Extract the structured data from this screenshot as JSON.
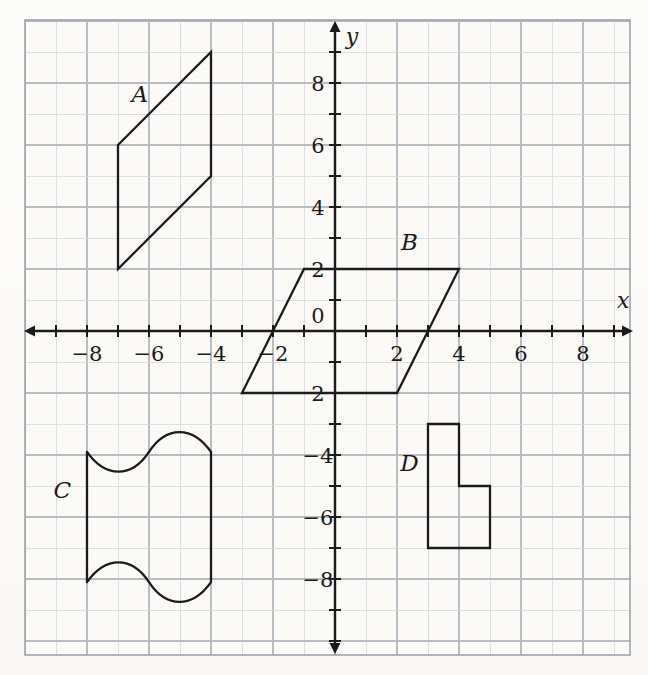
{
  "figure": {
    "kind": "coordinate-plane-with-figures",
    "background_color": "#fbfaf7",
    "grid_color": "#b9bcc2",
    "grid_minor_color": "#d6d8dc",
    "axis_color": "#1b1b1b",
    "shape_stroke_color": "#1b1b1b",
    "frame": {
      "x_min_px": 25,
      "y_min_px": 20,
      "x_max_px": 630,
      "y_max_px": 655
    },
    "origin_px": {
      "x": 335,
      "y": 331
    },
    "unit_px": 31,
    "x_range": [
      -9.9,
      9.5
    ],
    "y_range": [
      -10.4,
      9.9
    ]
  },
  "axes": {
    "x_axis_label": "x",
    "y_axis_label": "y",
    "origin_label": "0",
    "x_tick_labels": [
      {
        "value": -8,
        "text": "−8"
      },
      {
        "value": -6,
        "text": "−6"
      },
      {
        "value": -4,
        "text": "−4"
      },
      {
        "value": -2,
        "text": "−2"
      },
      {
        "value": 2,
        "text": "2"
      },
      {
        "value": 4,
        "text": "4"
      },
      {
        "value": 6,
        "text": "6"
      },
      {
        "value": 8,
        "text": "8"
      }
    ],
    "y_tick_labels": [
      {
        "value": 8,
        "text": "8"
      },
      {
        "value": 6,
        "text": "6"
      },
      {
        "value": 4,
        "text": "4"
      },
      {
        "value": 2,
        "text": "2"
      },
      {
        "value": -2,
        "text": "2"
      },
      {
        "value": -4,
        "text": "−4"
      },
      {
        "value": -6,
        "text": "−6"
      },
      {
        "value": -8,
        "text": "−8"
      }
    ],
    "tick_values_x": [
      -9,
      -8,
      -7,
      -6,
      -5,
      -4,
      -3,
      -2,
      -1,
      1,
      2,
      3,
      4,
      5,
      6,
      7,
      8,
      9
    ],
    "tick_values_y": [
      -10,
      -9,
      -8,
      -7,
      -6,
      -5,
      -4,
      -3,
      -2,
      -1,
      1,
      2,
      3,
      4,
      5,
      6,
      7,
      8,
      9
    ]
  },
  "shapes": [
    {
      "id": "A",
      "label": "A",
      "type": "parallelogram",
      "label_point": [
        -6.3,
        7.4
      ],
      "vertices": [
        [
          -7.0,
          6.0
        ],
        [
          -4.0,
          9.0
        ],
        [
          -4.0,
          5.0
        ],
        [
          -7.0,
          2.0
        ]
      ]
    },
    {
      "id": "B",
      "label": "B",
      "type": "parallelogram",
      "label_point": [
        2.4,
        2.6
      ],
      "vertices": [
        [
          -1.0,
          2.0
        ],
        [
          4.0,
          2.0
        ],
        [
          2.0,
          -2.0
        ],
        [
          -3.0,
          -2.0
        ]
      ]
    },
    {
      "id": "C",
      "label": "C",
      "type": "wavy-rectangle",
      "label_point": [
        -8.8,
        -5.4
      ],
      "left_x": -8.0,
      "right_x": -4.0,
      "top_y": -3.9,
      "bottom_y": -8.1,
      "wave_mid_x": -6.0,
      "wave_amplitude": 0.85
    },
    {
      "id": "D",
      "label": "D",
      "type": "l-shape",
      "label_point": [
        2.4,
        -4.5
      ],
      "vertices": [
        [
          3.0,
          -3.0
        ],
        [
          4.0,
          -3.0
        ],
        [
          4.0,
          -5.0
        ],
        [
          5.0,
          -5.0
        ],
        [
          5.0,
          -7.0
        ],
        [
          3.0,
          -7.0
        ]
      ]
    }
  ],
  "chart_data": {
    "type": "scatter",
    "title": "",
    "xlabel": "x",
    "ylabel": "y",
    "xlim": [
      -9.9,
      9.5
    ],
    "ylim": [
      -10.4,
      9.9
    ],
    "grid": true,
    "legend": "none",
    "annotations": [
      "A",
      "B",
      "C",
      "D"
    ],
    "series": [
      {
        "name": "A",
        "closed": true,
        "x": [
          -7,
          -4,
          -4,
          -7
        ],
        "y": [
          6,
          9,
          5,
          2
        ]
      },
      {
        "name": "B",
        "closed": true,
        "x": [
          -1,
          4,
          2,
          -3
        ],
        "y": [
          2,
          2,
          -2,
          -2
        ]
      },
      {
        "name": "C",
        "closed": true,
        "x": [
          -8,
          -4,
          -4,
          -8
        ],
        "y": [
          -3.9,
          -3.9,
          -8.1,
          -8.1
        ]
      },
      {
        "name": "D",
        "closed": true,
        "x": [
          3,
          4,
          4,
          5,
          5,
          3
        ],
        "y": [
          -3,
          -3,
          -5,
          -5,
          -7,
          -7
        ]
      }
    ]
  }
}
